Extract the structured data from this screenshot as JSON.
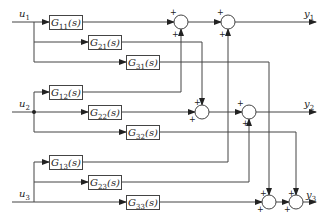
{
  "diagram": {
    "type": "MIMO 3x3 block diagram",
    "inputs": [
      {
        "id": "u1",
        "label": "u1"
      },
      {
        "id": "u2",
        "label": "u2"
      },
      {
        "id": "u3",
        "label": "u3"
      }
    ],
    "outputs": [
      {
        "id": "y1",
        "label": "y1"
      },
      {
        "id": "y2",
        "label": "y2"
      },
      {
        "id": "y3",
        "label": "y3"
      }
    ],
    "blocks": [
      {
        "id": "G11",
        "label": "G11(s)"
      },
      {
        "id": "G21",
        "label": "G21(s)"
      },
      {
        "id": "G31",
        "label": "G31(s)"
      },
      {
        "id": "G12",
        "label": "G12(s)"
      },
      {
        "id": "G22",
        "label": "G22(s)"
      },
      {
        "id": "G32",
        "label": "G32(s)"
      },
      {
        "id": "G13",
        "label": "G13(s)"
      },
      {
        "id": "G23",
        "label": "G23(s)"
      },
      {
        "id": "G33",
        "label": "G33(s)"
      }
    ],
    "summing_junction_sign": "+",
    "connections": [
      "u1 -> G11 -> sum1(y1)",
      "u1 -> G21 -> sum3(y2)",
      "u1 -> G31 -> sum5(y3)",
      "u2 -> G12 -> sum1(y1)",
      "u2 -> G22 -> sum3(y2)",
      "u2 -> G32 -> sum6(y3)",
      "u3 -> G13 -> sum2(y1)",
      "u3 -> G23 -> sum4(y2)",
      "u3 -> G33 -> sum5(y3)"
    ]
  }
}
